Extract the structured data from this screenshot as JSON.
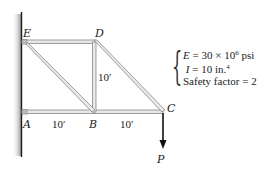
{
  "diagram": {
    "type": "truss",
    "nodes": {
      "E": {
        "label": "E",
        "x": 22,
        "y": 42
      },
      "D": {
        "label": "D",
        "x": 94,
        "y": 42
      },
      "A": {
        "label": "A",
        "x": 22,
        "y": 112
      },
      "B": {
        "label": "B",
        "x": 94,
        "y": 112
      },
      "C": {
        "label": "C",
        "x": 163,
        "y": 112
      }
    },
    "members": [
      [
        "E",
        "D"
      ],
      [
        "A",
        "B"
      ],
      [
        "B",
        "C"
      ],
      [
        "D",
        "B"
      ],
      [
        "E",
        "B"
      ],
      [
        "D",
        "C"
      ]
    ],
    "dimensions": {
      "AB": "10′",
      "BC": "10′",
      "DB": "10′"
    },
    "load": {
      "label": "P",
      "at": "C",
      "direction": "down"
    },
    "support": "wall"
  },
  "properties": {
    "E_symbol": "E",
    "E_value": " = 30 × 10",
    "E_exp": "6",
    "E_unit": " psi",
    "I_symbol": "I",
    "I_value": " = 10 in.",
    "I_exp": "4",
    "safety": "Safety factor = 2"
  },
  "colors": {
    "member_fill": "#e6e6e6",
    "member_stroke": "#8a8a8a",
    "wall_line": "#1a1a1a",
    "wall_shade": "#9a9a9a",
    "arrow": "#111111"
  }
}
